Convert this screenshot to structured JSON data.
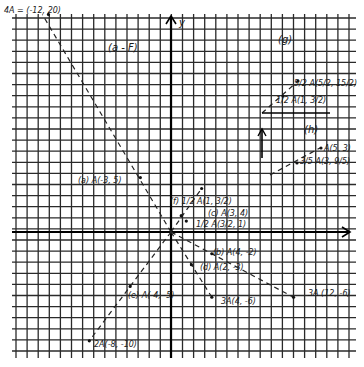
{
  "figure": {
    "axis_labels": {
      "y": "y",
      "x": "x"
    },
    "part_labels": {
      "a_to_f": "(a - F)",
      "g": "(g)",
      "h": "(h)"
    },
    "points": [
      {
        "label": "4A = (-12, 20)",
        "x": -12,
        "y": 20
      },
      {
        "label": "(a) A(-3, 5)",
        "x": -3,
        "y": 5
      },
      {
        "label": "(f) 1/2 A(1, 3/2)",
        "x": 1,
        "y": 1.5
      },
      {
        "label": "(c) A(3, 4)",
        "x": 3,
        "y": 4
      },
      {
        "label": "1/2 A(3/2, 1)",
        "x": 1.5,
        "y": 1
      },
      {
        "label": "(b) A(4, -2)",
        "x": 4,
        "y": -2
      },
      {
        "label": "(d) A(2, -3)",
        "x": 2,
        "y": -3
      },
      {
        "label": "3A(4, -6)",
        "x": 4,
        "y": -6
      },
      {
        "label": "3A (12, -6)",
        "x": 12,
        "y": -6
      },
      {
        "label": "(e) A(-4, -5)",
        "x": -4,
        "y": -5
      },
      {
        "label": "2A(-8, -10)",
        "x": -8,
        "y": -10
      },
      {
        "label": "5/2 A(5/2, 15/2)",
        "x": 2.5,
        "y": 7.5
      },
      {
        "label": "1/2 A(1, 3/2)",
        "x": 1,
        "y": 1.5
      },
      {
        "label": "A(5, 3)",
        "x": 5,
        "y": 3
      },
      {
        "label": "3/5 A(3, 9/5)",
        "x": 3,
        "y": 1.8
      }
    ]
  }
}
